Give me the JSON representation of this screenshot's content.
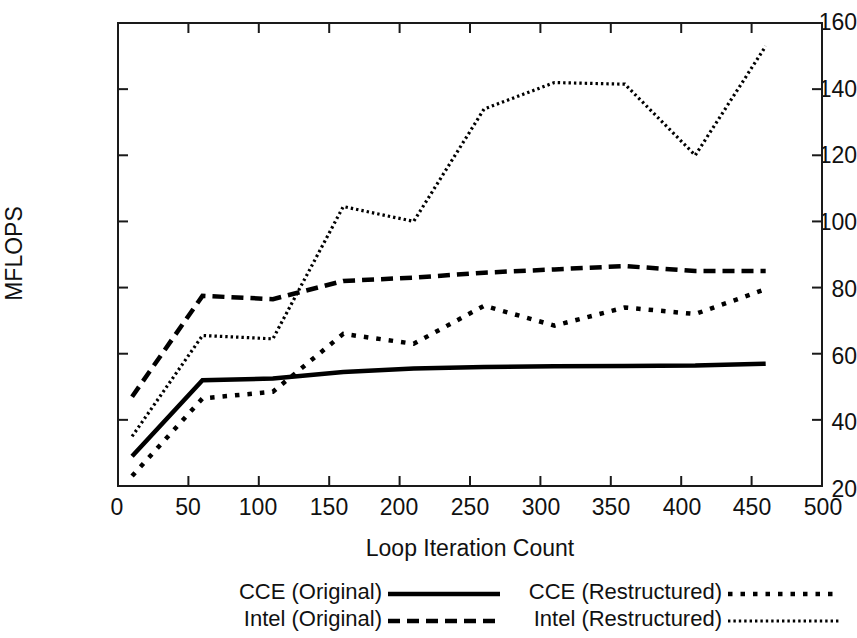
{
  "chart_data": {
    "type": "line",
    "title": "",
    "xlabel": "Loop Iteration Count",
    "ylabel": "MFLOPS",
    "xlim": [
      0,
      500
    ],
    "ylim": [
      20,
      160
    ],
    "xticks": [
      0,
      50,
      100,
      150,
      200,
      250,
      300,
      350,
      400,
      450,
      500
    ],
    "yticks": [
      20,
      40,
      60,
      80,
      100,
      120,
      140,
      160
    ],
    "grid": false,
    "legend_position": "below",
    "x": [
      10,
      60,
      110,
      160,
      210,
      260,
      310,
      360,
      410,
      460
    ],
    "series": [
      {
        "name": "CCE (Original)",
        "style": "solid",
        "color": "#000000",
        "values": [
          29,
          52,
          52.5,
          54.5,
          55.5,
          56,
          56.2,
          56.3,
          56.4,
          57
        ]
      },
      {
        "name": "Intel (Original)",
        "style": "dashed",
        "color": "#000000",
        "values": [
          47,
          77.5,
          76.5,
          82,
          83,
          84.5,
          85.5,
          86.5,
          85,
          85
        ]
      },
      {
        "name": "CCE (Restructured)",
        "style": "dotted",
        "color": "#000000",
        "values": [
          23,
          46.5,
          48.5,
          66,
          63,
          74.5,
          68.5,
          74,
          72,
          79.5
        ]
      },
      {
        "name": "Intel (Restructured)",
        "style": "fine-dotted",
        "color": "#000000",
        "values": [
          35,
          65.5,
          64.5,
          104.5,
          100,
          134,
          142,
          141.5,
          120,
          153
        ]
      }
    ]
  },
  "axis": {
    "y_labels": [
      "160",
      "140",
      "120",
      "100",
      "80",
      "60",
      "40",
      "20"
    ],
    "x_labels": [
      "0",
      "50",
      "100",
      "150",
      "200",
      "250",
      "300",
      "350",
      "400",
      "450",
      "500"
    ],
    "y_title": "MFLOPS",
    "x_title": "Loop Iteration Count"
  },
  "legend": {
    "left": [
      {
        "label": "CCE (Original)",
        "style": "solid"
      },
      {
        "label": "Intel (Original)",
        "style": "dashed"
      }
    ],
    "right": [
      {
        "label": "CCE (Restructured)",
        "style": "dotted"
      },
      {
        "label": "Intel (Restructured)",
        "style": "fine-dotted"
      }
    ]
  }
}
